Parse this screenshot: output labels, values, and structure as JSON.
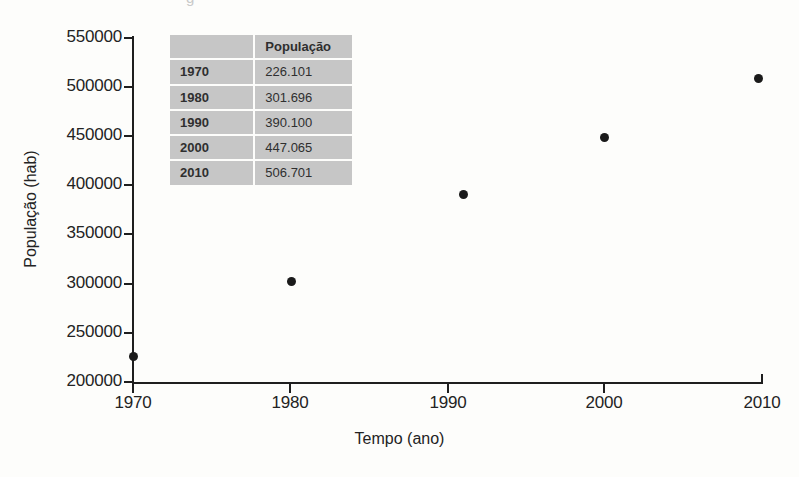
{
  "figure": {
    "title_remnant": "g",
    "background_color": "#fdfdfb",
    "ink_color": "#1e1e1e",
    "point_color": "#1a1a1a",
    "table_cell_color": "#c6c6c6"
  },
  "chart_data": {
    "type": "scatter",
    "title": "",
    "xlabel": "Tempo (ano)",
    "ylabel": "População (hab)",
    "x": [
      1970,
      1980,
      1990,
      2000,
      2010
    ],
    "values": [
      226101,
      301696,
      390100,
      447065,
      506701
    ],
    "xlim": [
      1970,
      2010
    ],
    "ylim": [
      200000,
      550000
    ],
    "xticks": [
      "1970",
      "1980",
      "1990",
      "2000",
      "2010"
    ],
    "yticks": [
      "200000",
      "250000",
      "300000",
      "350000",
      "400000",
      "450000",
      "500000",
      "550000"
    ],
    "grid": false,
    "legend": false,
    "points": [
      {
        "year": "1970",
        "population": "226.101",
        "px": 133,
        "py": 356
      },
      {
        "year": "1980",
        "population": "301.696",
        "px": 291,
        "py": 281
      },
      {
        "year": "1990",
        "population": "390.100",
        "px": 463,
        "py": 194
      },
      {
        "year": "2000",
        "population": "447.065",
        "px": 604,
        "py": 137
      },
      {
        "year": "2010",
        "population": "506.701",
        "px": 758,
        "py": 78
      }
    ]
  },
  "axes": {
    "y_ticks": [
      {
        "label": "550000",
        "py": 38
      },
      {
        "label": "500000",
        "py": 87
      },
      {
        "label": "450000",
        "py": 136
      },
      {
        "label": "400000",
        "py": 185
      },
      {
        "label": "350000",
        "py": 234
      },
      {
        "label": "300000",
        "py": 284
      },
      {
        "label": "250000",
        "py": 333
      },
      {
        "label": "200000",
        "py": 382
      }
    ],
    "x_ticks": [
      {
        "label": "1970",
        "px": 133
      },
      {
        "label": "1980",
        "px": 290
      },
      {
        "label": "1990",
        "px": 448
      },
      {
        "label": "2000",
        "px": 604
      },
      {
        "label": "2010",
        "px": 762
      }
    ]
  },
  "table": {
    "header": {
      "year": "",
      "population": "População"
    },
    "rows": [
      {
        "year": "1970",
        "population": "226.101"
      },
      {
        "year": "1980",
        "population": "301.696"
      },
      {
        "year": "1990",
        "population": "390.100"
      },
      {
        "year": "2000",
        "population": "447.065"
      },
      {
        "year": "2010",
        "population": "506.701"
      }
    ]
  }
}
